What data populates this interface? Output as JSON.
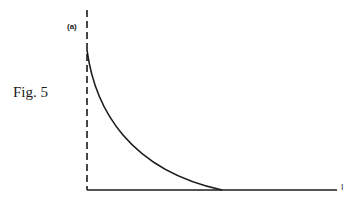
{
  "figure": {
    "caption": "Fig. 5",
    "panel_label": "(a)",
    "x_axis_end_label": "I"
  },
  "diagram": {
    "type": "decay-curve",
    "elements": [
      {
        "kind": "dashed-vertical-axis",
        "x": 87,
        "y_top": 10,
        "y_bottom": 190
      },
      {
        "kind": "solid-horizontal-axis",
        "y": 190,
        "x_start": 87,
        "x_end": 337
      },
      {
        "kind": "curve",
        "description": "monotonically decreasing convex curve from top of vertical axis to baseline, tangent at baseline",
        "start": [
          87,
          50
        ],
        "end": [
          222,
          190
        ]
      }
    ],
    "stroke_color": "#1a1a1a"
  }
}
